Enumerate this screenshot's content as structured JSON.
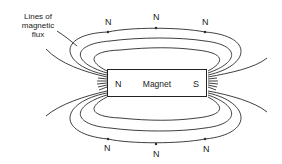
{
  "diagram": {
    "title_label": {
      "line1": "Lines of",
      "line2": "magnetic",
      "line3": "flux"
    },
    "magnet": {
      "name": "Magnet",
      "north_pole": "N",
      "south_pole": "S"
    },
    "direction_markers": {
      "top": [
        "N",
        "N",
        "N"
      ],
      "bottom": [
        "N",
        "N",
        "N"
      ]
    },
    "colors": {
      "line": "#2a2a2a",
      "background": "#ffffff"
    }
  }
}
